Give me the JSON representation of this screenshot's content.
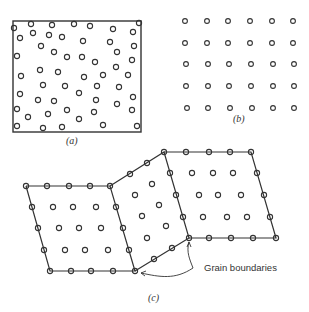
{
  "panels": {
    "a": {
      "caption": "(a)",
      "description": "Amorphous (random) arrangement of atoms inside a box"
    },
    "b": {
      "caption": "(b)",
      "description": "Regular crystalline lattice, 6 columns x 5 rows"
    },
    "c": {
      "caption": "(c)",
      "description": "Polycrystal with three grains",
      "annotation": "Grain boundaries"
    }
  },
  "colors": {
    "stroke": "#333333",
    "background": "#ffffff"
  }
}
